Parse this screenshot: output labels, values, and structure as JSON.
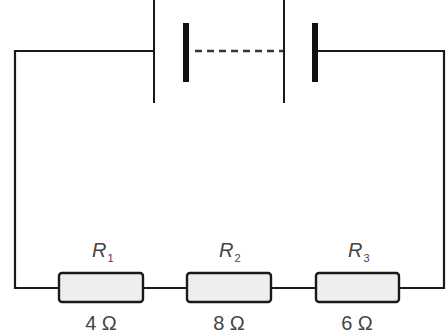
{
  "diagram": {
    "type": "series circuit",
    "battery": {
      "cells_shown": 2,
      "middle_connection": "dashed"
    },
    "resistors": [
      {
        "name": "R",
        "subscript": "1",
        "value": "4 Ω"
      },
      {
        "name": "R",
        "subscript": "2",
        "value": "8 Ω"
      },
      {
        "name": "R",
        "subscript": "3",
        "value": "6 Ω"
      }
    ],
    "colors": {
      "wire": "#1a1a1a",
      "resistor_fill": "#eeeeee",
      "text": "#444444"
    }
  }
}
